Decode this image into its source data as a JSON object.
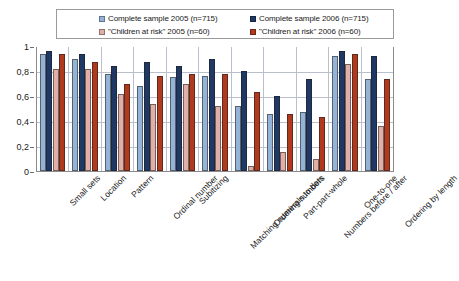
{
  "chart_data": {
    "type": "bar",
    "title": "",
    "xlabel": "",
    "ylabel": "",
    "ylim": [
      0,
      1
    ],
    "yticks": [
      0,
      0.2,
      0.4,
      0.6,
      0.8,
      1
    ],
    "ytick_labels": [
      "0",
      "0,2",
      "0,4",
      "0,6",
      "0,8",
      "1"
    ],
    "grid": true,
    "legend_position": "top",
    "categories": [
      "Small sets",
      "Location",
      "Pattern",
      "Ordinal number",
      "Subitizing",
      "Matching numerals to dots",
      "Ordering numbers",
      "Part-part-whole",
      "Numbers before / after",
      "One-to-one",
      "Ordering by length"
    ],
    "series": [
      {
        "name": "Complete sample 2005 (n=715)",
        "color": "#95B3D7",
        "values": [
          0.94,
          0.9,
          0.78,
          0.68,
          0.75,
          0.76,
          0.52,
          0.46,
          0.47,
          0.92,
          0.74
        ]
      },
      {
        "name": "Complete sample 2006 (n=715)",
        "color": "#1F3864",
        "values": [
          0.96,
          0.94,
          0.84,
          0.87,
          0.84,
          0.9,
          0.8,
          0.6,
          0.74,
          0.96,
          0.92
        ]
      },
      {
        "name": "\"Children at risk\" 2005 (n=60)",
        "color": "#E0B0A8",
        "values": [
          0.82,
          0.82,
          0.62,
          0.54,
          0.7,
          0.52,
          0.04,
          0.15,
          0.1,
          0.86,
          0.36
        ]
      },
      {
        "name": "\"Children at risk\" 2006 (n=60)",
        "color": "#B03A1E",
        "values": [
          0.94,
          0.87,
          0.7,
          0.76,
          0.78,
          0.78,
          0.63,
          0.46,
          0.43,
          0.94,
          0.74
        ]
      }
    ]
  },
  "legend": {
    "entries": [
      {
        "label": "Complete sample 2005 (n=715)",
        "color": "#95B3D7"
      },
      {
        "label": "Complete sample 2006 (n=715)",
        "color": "#1F3864"
      },
      {
        "label": "\"Children at risk\" 2005 (n=60)",
        "color": "#E0B0A8"
      },
      {
        "label": "\"Children at risk\" 2006 (n=60)",
        "color": "#B03A1E"
      }
    ]
  }
}
